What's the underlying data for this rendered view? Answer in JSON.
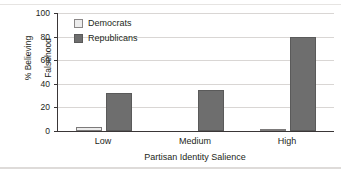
{
  "figure": {
    "title": "",
    "title_truncated": true
  },
  "legend": {
    "position": "inside-top-left",
    "entries": [
      {
        "label": "Democrats",
        "swatch": "light-swatch-icon",
        "color": "#ececec"
      },
      {
        "label": "Republicans",
        "swatch": "dark-swatch-icon",
        "color": "#6e6e6e"
      }
    ]
  },
  "axes": {
    "y_title_line1": "% Believing",
    "y_title_line2": "Falsehood",
    "x_title": "Partisan Identity Salience",
    "y_ticks": [
      "0",
      "20",
      "40",
      "60",
      "80",
      "100"
    ],
    "x_ticks": [
      "Low",
      "Medium",
      "High"
    ]
  },
  "chart_data": {
    "type": "bar",
    "title": "",
    "categories": [
      "Low",
      "Medium",
      "High"
    ],
    "series": [
      {
        "name": "Democrats",
        "values": [
          3,
          0,
          2
        ],
        "color": "#ececec"
      },
      {
        "name": "Republicans",
        "values": [
          32,
          35,
          80
        ],
        "color": "#6e6e6e"
      }
    ],
    "xlabel": "Partisan Identity Salience",
    "ylabel": "% Believing Falsehood",
    "ylim": [
      0,
      100
    ],
    "yticks": [
      0,
      20,
      40,
      60,
      80,
      100
    ],
    "grid": "horizontal",
    "legend_position": "upper left inside"
  }
}
